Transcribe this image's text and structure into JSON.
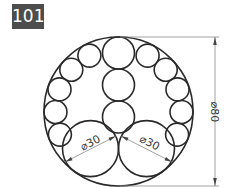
{
  "figure": {
    "number": "101",
    "badge_color": "#4d4d4d",
    "line_color": "#2a2a2a",
    "dimension_color": "#888888"
  },
  "dimensions": {
    "outer_diameter": "⌀80",
    "left_circle_diameter": "⌀30",
    "right_circle_diameter": "⌀30"
  },
  "geometry": {
    "outer_circle": {
      "cx": 118.5,
      "cy": 111.5,
      "r": 74.5
    },
    "large_circles": [
      {
        "cx": 90.5,
        "cy": 148.6,
        "r": 28
      },
      {
        "cx": 146.5,
        "cy": 148.6,
        "r": 28
      }
    ],
    "center_column": [
      {
        "cx": 118.5,
        "cy": 53,
        "r": 16
      },
      {
        "cx": 118.5,
        "cy": 85,
        "r": 16
      },
      {
        "cx": 118.5,
        "cy": 117,
        "r": 16
      }
    ],
    "ring_circles": [
      {
        "cx": 89.4,
        "cy": 55.6,
        "r": 11.5
      },
      {
        "cx": 71.3,
        "cy": 69.8,
        "r": 11.5
      },
      {
        "cx": 59.5,
        "cy": 89.4,
        "r": 11.5
      },
      {
        "cx": 55.5,
        "cy": 112.0,
        "r": 11.5
      },
      {
        "cx": 59.9,
        "cy": 134.6,
        "r": 11.5
      },
      {
        "cx": 147.6,
        "cy": 55.6,
        "r": 11.5
      },
      {
        "cx": 165.7,
        "cy": 69.8,
        "r": 11.5
      },
      {
        "cx": 177.5,
        "cy": 89.4,
        "r": 11.5
      },
      {
        "cx": 181.5,
        "cy": 112.0,
        "r": 11.5
      },
      {
        "cx": 177.1,
        "cy": 134.6,
        "r": 11.5
      }
    ]
  }
}
